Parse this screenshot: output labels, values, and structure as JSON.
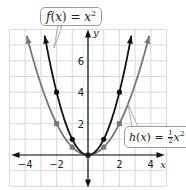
{
  "chart_data": {
    "type": "line",
    "title": "",
    "xlabel": "x",
    "ylabel": "y",
    "xlim": [
      -5,
      5
    ],
    "ylim": [
      -2,
      8
    ],
    "grid": true,
    "x_ticks": [
      -4,
      -2,
      2,
      4
    ],
    "y_ticks": [
      2,
      4,
      6
    ],
    "series": [
      {
        "name": "f(x) = x^2",
        "color": "#111111",
        "points": [
          [
            -2,
            4
          ],
          [
            -1,
            1
          ],
          [
            0,
            0
          ],
          [
            1,
            1
          ],
          [
            2,
            4
          ]
        ],
        "marked_points": [
          [
            -2,
            4
          ],
          [
            -1,
            1
          ],
          [
            0,
            0
          ],
          [
            1,
            1
          ],
          [
            2,
            4
          ]
        ]
      },
      {
        "name": "h(x) = 1/2 x^2",
        "color": "#777777",
        "points": [
          [
            -2,
            2
          ],
          [
            -1,
            0.5
          ],
          [
            0,
            0
          ],
          [
            1,
            0.5
          ],
          [
            2,
            2
          ]
        ],
        "marked_points": [
          [
            -2,
            2
          ],
          [
            -1,
            0.5
          ],
          [
            0,
            0
          ],
          [
            1,
            0.5
          ],
          [
            2,
            2
          ]
        ]
      }
    ],
    "annotations": [
      {
        "text": "f(x) = x²",
        "target": "f"
      },
      {
        "text": "h(x) = ½x²",
        "target": "h"
      }
    ]
  },
  "labels": {
    "x_axis": "x",
    "y_axis": "y",
    "x_tick_labels": [
      "−4",
      "−2",
      "2",
      "4"
    ],
    "y_tick_labels": [
      "2",
      "4",
      "6"
    ],
    "f_name": "f",
    "f_var": "x",
    "f_eq": " = ",
    "f_rhs": "x",
    "f_exp": "2",
    "h_name": "h",
    "h_var": "x",
    "h_eq": " = ",
    "h_num": "1",
    "h_den": "2",
    "h_rhs": "x",
    "h_exp": "2"
  }
}
